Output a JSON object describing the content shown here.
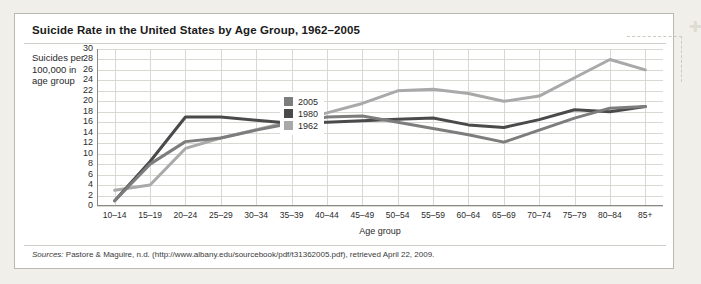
{
  "figure": {
    "title": "Suicide Rate in the United States by Age Group, 1962–2005",
    "y_axis_caption": "Suicides per 100,000 in age group",
    "sources_label": "Sources:",
    "sources_text": " Pastore & Maguire, n.d. (http://www.albany.edu/sourcebook/pdf/t31362005.pdf), retrieved April 22, 2009."
  },
  "chart_data": {
    "type": "line",
    "title": "Suicide Rate in the United States by Age Group, 1962–2005",
    "xlabel": "Age group",
    "ylabel": "Suicides per 100,000 in age group",
    "ylim": [
      0,
      30
    ],
    "ytick_step": 2,
    "yticks": [
      30,
      28,
      26,
      24,
      22,
      20,
      18,
      16,
      14,
      12,
      10,
      8,
      6,
      4,
      2,
      0
    ],
    "grid": true,
    "legend_position": "inside-upper-left",
    "categories": [
      "10–14",
      "15–19",
      "20–24",
      "25–29",
      "30–34",
      "35–39",
      "40–44",
      "45–49",
      "50–54",
      "55–59",
      "60–64",
      "65–69",
      "70–74",
      "75–79",
      "80–84",
      "85+"
    ],
    "series": [
      {
        "name": "2005",
        "color": "#7d7d7d",
        "values": [
          1.0,
          8.0,
          12.3,
          13.0,
          14.5,
          15.8,
          17.0,
          17.2,
          16.0,
          14.8,
          13.6,
          12.2,
          14.5,
          16.8,
          18.7,
          19.0
        ]
      },
      {
        "name": "1980",
        "color": "#4a4a4a",
        "values": [
          1.0,
          8.5,
          17.0,
          17.0,
          16.4,
          15.8,
          16.0,
          16.3,
          16.6,
          16.8,
          15.5,
          15.0,
          16.5,
          18.4,
          18.0,
          19.0
        ]
      },
      {
        "name": "1962",
        "color": "#a9a9a9",
        "values": [
          3.0,
          4.0,
          11.0,
          13.0,
          14.6,
          16.2,
          17.8,
          19.6,
          22.0,
          22.3,
          21.5,
          20.0,
          21.0,
          24.5,
          28.0,
          26.0
        ]
      }
    ]
  },
  "legend": {
    "items": [
      {
        "label": "2005",
        "color": "#7d7d7d"
      },
      {
        "label": "1980",
        "color": "#4a4a4a"
      },
      {
        "label": "1962",
        "color": "#a9a9a9"
      }
    ]
  }
}
